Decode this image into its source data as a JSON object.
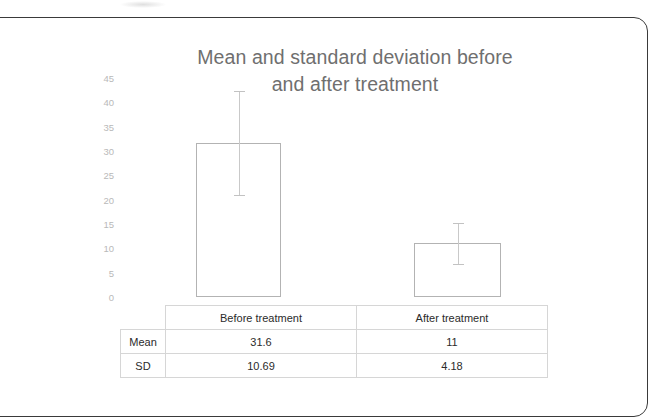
{
  "chart_data": {
    "type": "bar",
    "title": "Mean and standard deviation before\nand after treatment",
    "title_line1": "Mean and standard deviation before",
    "title_line2": "and after treatment",
    "categories": [
      "Before treatment",
      "After treatment"
    ],
    "values": [
      31.6,
      11
    ],
    "errors": [
      10.69,
      4.18
    ],
    "series": [
      {
        "name": "Mean",
        "values": [
          31.6,
          11
        ]
      },
      {
        "name": "SD",
        "values": [
          10.69,
          4.18
        ]
      }
    ],
    "xlabel": "",
    "ylabel": "",
    "ylim": [
      0,
      45
    ],
    "ytick_step": 5,
    "yticks": [
      45,
      40,
      35,
      30,
      25,
      20,
      15,
      10,
      5,
      0
    ],
    "ytick_labels": [
      "45",
      "40",
      "35",
      "30",
      "25",
      "20",
      "15",
      "10",
      "5",
      "0"
    ],
    "grid": false,
    "legend": "none",
    "error_bar_style": "capped",
    "bar_fill": "none",
    "bar_outline_color": "#b3b3b3",
    "title_color": "#6f6f6f",
    "tick_color": "#b9b9b9"
  },
  "table": {
    "corner_label": "",
    "column_headers": [
      "",
      "Before treatment",
      "After treatment"
    ],
    "rows": [
      {
        "label": "Mean",
        "cells": [
          "31.6",
          "11"
        ]
      },
      {
        "label": "SD",
        "cells": [
          "10.69",
          "4.18"
        ]
      }
    ]
  }
}
